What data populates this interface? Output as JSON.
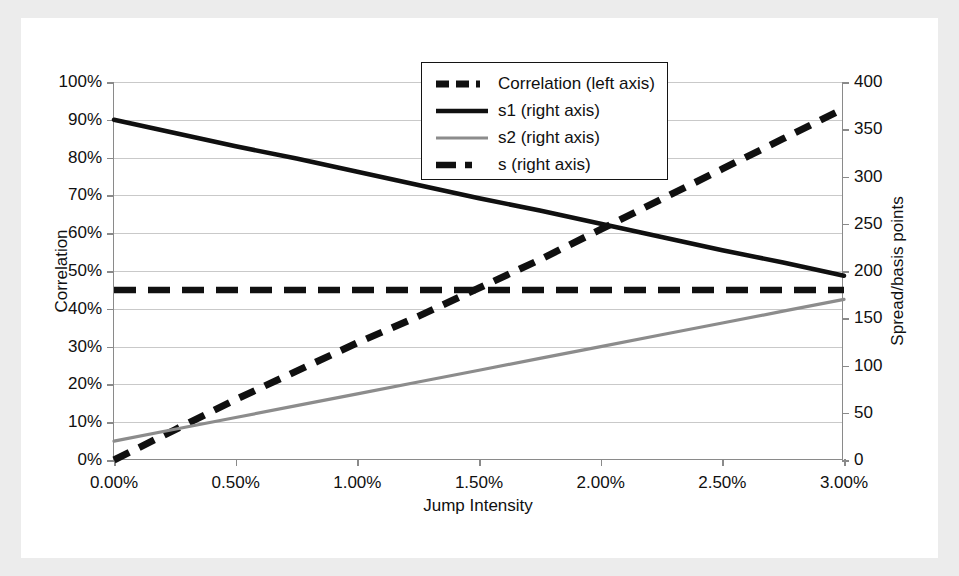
{
  "figure": {
    "background": "#ececec",
    "canvas_background": "#ffffff"
  },
  "axes": {
    "left": {
      "title": "Correlation",
      "ticks": [
        "0%",
        "10%",
        "20%",
        "30%",
        "40%",
        "50%",
        "60%",
        "70%",
        "80%",
        "90%",
        "100%"
      ]
    },
    "right": {
      "title": "Spread/basis points",
      "ticks": [
        "0",
        "50",
        "100",
        "150",
        "200",
        "250",
        "300",
        "350",
        "400"
      ]
    },
    "x": {
      "title": "Jump Intensity",
      "ticks": [
        "0.00%",
        "0.50%",
        "1.00%",
        "1.50%",
        "2.00%",
        "2.50%",
        "3.00%"
      ]
    }
  },
  "legend": {
    "items": [
      {
        "label": "Correlation (left axis)",
        "style": "dashed-dotted",
        "color": "#101010"
      },
      {
        "label": "s1 (right axis)",
        "style": "solid",
        "color": "#101010"
      },
      {
        "label": "s2 (right axis)",
        "style": "solid-thin",
        "color": "#8c8c8c"
      },
      {
        "label": "s (right axis)",
        "style": "dashed",
        "color": "#101010"
      }
    ]
  },
  "chart_data": {
    "type": "line",
    "title": "",
    "xlabel": "Jump Intensity",
    "ylabel": "Correlation",
    "y2label": "Spread/basis points",
    "xlim": [
      0.0,
      3.0
    ],
    "ylim": [
      0,
      100
    ],
    "y2lim": [
      0,
      400
    ],
    "xtick_values": [
      0.0,
      0.5,
      1.0,
      1.5,
      2.0,
      2.5,
      3.0
    ],
    "ytick_values": [
      0,
      10,
      20,
      30,
      40,
      50,
      60,
      70,
      80,
      90,
      100
    ],
    "y2tick_values": [
      0,
      50,
      100,
      150,
      200,
      250,
      300,
      350,
      400
    ],
    "grid": true,
    "grid_axis": "y",
    "legend_position": "upper center",
    "x": [
      0.0,
      0.25,
      0.5,
      0.75,
      1.0,
      1.25,
      1.5,
      1.75,
      2.0,
      2.25,
      2.5,
      2.75,
      3.0
    ],
    "series": [
      {
        "name": "Correlation (left axis)",
        "axis": "left",
        "units": "%",
        "style": "dashed-dotted",
        "color": "#101010",
        "values": [
          0,
          8,
          16,
          23.5,
          31,
          38,
          45.5,
          53,
          61,
          69,
          77,
          85,
          93
        ]
      },
      {
        "name": "s1 (right axis)",
        "axis": "right",
        "units": "basis points",
        "style": "solid",
        "color": "#101010",
        "values": [
          360,
          346,
          332,
          319,
          305,
          291,
          277,
          264,
          250,
          236,
          222,
          209,
          195
        ]
      },
      {
        "name": "s2 (right axis)",
        "axis": "right",
        "units": "basis points",
        "style": "solid-thin",
        "color": "#8c8c8c",
        "values": [
          20,
          32.5,
          45,
          57.5,
          70,
          82.5,
          95,
          107.5,
          120,
          132.5,
          145,
          157.5,
          170
        ]
      },
      {
        "name": "s (right axis)",
        "axis": "right",
        "units": "basis points",
        "style": "dashed",
        "color": "#101010",
        "values": [
          180,
          180,
          180,
          180,
          180,
          180,
          180,
          180,
          180,
          180,
          180,
          180,
          180
        ]
      }
    ]
  }
}
